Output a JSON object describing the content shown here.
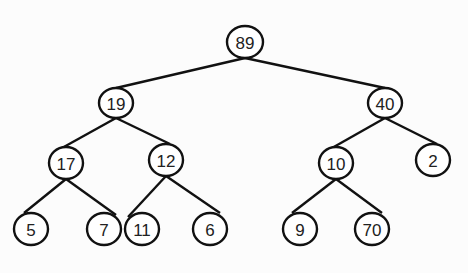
{
  "diagram": {
    "type": "binary-tree",
    "stroke_color": "#111111",
    "background": "#fcfcfc",
    "nodes": [
      {
        "id": "n89",
        "label": "89",
        "x": 245,
        "y": 42,
        "rx": 18,
        "ry": 16
      },
      {
        "id": "n19",
        "label": "19",
        "x": 116,
        "y": 103,
        "rx": 17,
        "ry": 15
      },
      {
        "id": "n40",
        "label": "40",
        "x": 385,
        "y": 103,
        "rx": 17,
        "ry": 15
      },
      {
        "id": "n17",
        "label": "17",
        "x": 66,
        "y": 163,
        "rx": 17,
        "ry": 16
      },
      {
        "id": "n12",
        "label": "12",
        "x": 166,
        "y": 160,
        "rx": 17,
        "ry": 16
      },
      {
        "id": "n10",
        "label": "10",
        "x": 336,
        "y": 163,
        "rx": 17,
        "ry": 16
      },
      {
        "id": "n2",
        "label": "2",
        "x": 433,
        "y": 160,
        "rx": 17,
        "ry": 16
      },
      {
        "id": "n5",
        "label": "5",
        "x": 31,
        "y": 229,
        "rx": 17,
        "ry": 16
      },
      {
        "id": "n7",
        "label": "7",
        "x": 104,
        "y": 229,
        "rx": 17,
        "ry": 16
      },
      {
        "id": "n11",
        "label": "11",
        "x": 142,
        "y": 229,
        "rx": 17,
        "ry": 16
      },
      {
        "id": "n6",
        "label": "6",
        "x": 210,
        "y": 229,
        "rx": 17,
        "ry": 16
      },
      {
        "id": "n9",
        "label": "9",
        "x": 300,
        "y": 229,
        "rx": 17,
        "ry": 16
      },
      {
        "id": "n70",
        "label": "70",
        "x": 372,
        "y": 229,
        "rx": 17,
        "ry": 16
      }
    ],
    "edges": [
      {
        "from": "n89",
        "to": "n19",
        "x1": 245,
        "y1": 58,
        "x2": 116,
        "y2": 88
      },
      {
        "from": "n89",
        "to": "n40",
        "x1": 245,
        "y1": 58,
        "x2": 385,
        "y2": 88
      },
      {
        "from": "n19",
        "to": "n17",
        "x1": 116,
        "y1": 118,
        "x2": 62,
        "y2": 148
      },
      {
        "from": "n19",
        "to": "n12",
        "x1": 116,
        "y1": 118,
        "x2": 170,
        "y2": 144
      },
      {
        "from": "n40",
        "to": "n10",
        "x1": 385,
        "y1": 118,
        "x2": 332,
        "y2": 148
      },
      {
        "from": "n40",
        "to": "n2",
        "x1": 385,
        "y1": 118,
        "x2": 437,
        "y2": 144
      },
      {
        "from": "n17",
        "to": "n5",
        "x1": 66,
        "y1": 179,
        "x2": 24,
        "y2": 213
      },
      {
        "from": "n17",
        "to": "n7",
        "x1": 66,
        "y1": 179,
        "x2": 116,
        "y2": 215
      },
      {
        "from": "n12",
        "to": "n11",
        "x1": 166,
        "y1": 176,
        "x2": 128,
        "y2": 217
      },
      {
        "from": "n12",
        "to": "n6",
        "x1": 166,
        "y1": 176,
        "x2": 220,
        "y2": 213
      },
      {
        "from": "n10",
        "to": "n9",
        "x1": 336,
        "y1": 179,
        "x2": 292,
        "y2": 213
      },
      {
        "from": "n10",
        "to": "n70",
        "x1": 336,
        "y1": 179,
        "x2": 382,
        "y2": 213
      }
    ]
  }
}
